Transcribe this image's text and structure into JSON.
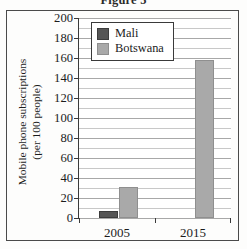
{
  "figure": {
    "title": "Figure 5",
    "frame_color": "#4a4a4a"
  },
  "chart_data": {
    "type": "bar",
    "title": "Figure 5",
    "xlabel": "",
    "ylabel": "Mobile phone subscriptions (per 100 people)",
    "ylabel_line1": "Mobile phone subscriptions",
    "ylabel_line2": "(per 100 people)",
    "categories": [
      "2005",
      "2015"
    ],
    "series": [
      {
        "name": "Mali",
        "color": "#565656",
        "values": [
          5,
          0
        ]
      },
      {
        "name": "Botswana",
        "color": "#a9a9a9",
        "values": [
          29,
          156
        ]
      }
    ],
    "ylim": [
      0,
      200
    ],
    "ytick_step": 20,
    "yticks": [
      0,
      20,
      40,
      60,
      80,
      100,
      120,
      140,
      160,
      180,
      200
    ],
    "ytick_labels": [
      "0",
      "20",
      "40",
      "60",
      "80",
      "100",
      "120",
      "140",
      "160",
      "180",
      "200"
    ],
    "minor_gridline_step": 10,
    "grid": true,
    "grid_axis": "y",
    "legend_position": "upper left inside plot",
    "legend_entries": [
      "Mali",
      "Botswana"
    ]
  }
}
